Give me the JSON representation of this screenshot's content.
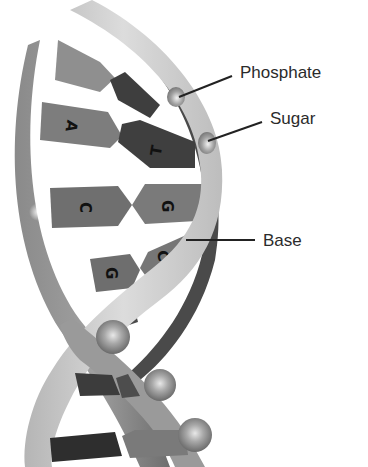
{
  "diagram": {
    "labels": {
      "phosphate": "Phosphate",
      "sugar": "Sugar",
      "base": "Base"
    },
    "base_pairs": [
      {
        "left": "A",
        "right": "T"
      },
      {
        "left": "C",
        "right": "G"
      },
      {
        "left": "G",
        "right": "C"
      }
    ],
    "colors": {
      "background": "#ffffff",
      "backbone_light": "#c9c9c9",
      "backbone_mid": "#8c8c8c",
      "backbone_dark": "#5a5a5a",
      "base_mid": "#7a7a7a",
      "base_dark": "#3a3a3a",
      "label_text": "#2b2b2b",
      "leader_line": "#222222"
    }
  }
}
